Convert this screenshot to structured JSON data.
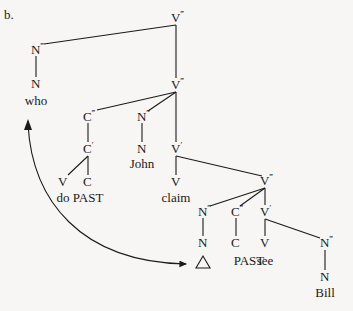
{
  "example_label": "b.",
  "tree": {
    "nodes": [
      {
        "id": "vmax1",
        "cat": "V",
        "bar": "‴",
        "x": 176,
        "y": 22
      },
      {
        "id": "nmax_who",
        "cat": "N",
        "bar": "‴",
        "x": 36,
        "y": 54
      },
      {
        "id": "n_who",
        "cat": "N",
        "bar": "",
        "x": 36,
        "y": 88
      },
      {
        "id": "vmax2",
        "cat": "V",
        "bar": "‴",
        "x": 176,
        "y": 89
      },
      {
        "id": "cmax1",
        "cat": "C",
        "bar": "‴",
        "x": 88,
        "y": 121
      },
      {
        "id": "nmax_john",
        "cat": "N",
        "bar": "‴",
        "x": 142,
        "y": 121
      },
      {
        "id": "cbar1",
        "cat": "C",
        "bar": "′",
        "x": 88,
        "y": 153
      },
      {
        "id": "n_john",
        "cat": "N",
        "bar": "",
        "x": 142,
        "y": 153
      },
      {
        "id": "vbar1",
        "cat": "V",
        "bar": "′",
        "x": 176,
        "y": 153
      },
      {
        "id": "v_do",
        "cat": "V",
        "bar": "",
        "x": 63,
        "y": 186
      },
      {
        "id": "c_past1",
        "cat": "C",
        "bar": "",
        "x": 88,
        "y": 186
      },
      {
        "id": "v_claim",
        "cat": "V",
        "bar": "",
        "x": 176,
        "y": 186
      },
      {
        "id": "vmax3",
        "cat": "V",
        "bar": "‴",
        "x": 265,
        "y": 185
      },
      {
        "id": "nmax_trace",
        "cat": "N",
        "bar": "‴",
        "x": 203,
        "y": 216
      },
      {
        "id": "cmax2",
        "cat": "C",
        "bar": "‴",
        "x": 236,
        "y": 216
      },
      {
        "id": "vbar2",
        "cat": "V",
        "bar": "′",
        "x": 265,
        "y": 216
      },
      {
        "id": "n_trace",
        "cat": "N",
        "bar": "",
        "x": 203,
        "y": 247
      },
      {
        "id": "c_past2",
        "cat": "C",
        "bar": "",
        "x": 236,
        "y": 247
      },
      {
        "id": "v_see",
        "cat": "V",
        "bar": "",
        "x": 265,
        "y": 247
      },
      {
        "id": "nmax_bill",
        "cat": "N",
        "bar": "‴",
        "x": 325,
        "y": 247
      },
      {
        "id": "n_bill",
        "cat": "N",
        "bar": "",
        "x": 325,
        "y": 281
      }
    ],
    "words": [
      {
        "id": "who",
        "text": "who",
        "x": 36,
        "y": 105
      },
      {
        "id": "john",
        "text": "John",
        "x": 142,
        "y": 168
      },
      {
        "id": "do_past",
        "text": "do PAST",
        "x": 80,
        "y": 202
      },
      {
        "id": "claim",
        "text": "claim",
        "x": 176,
        "y": 202
      },
      {
        "id": "past2",
        "text": "PAST",
        "x": 249,
        "y": 265
      },
      {
        "id": "see",
        "text": "see",
        "x": 265,
        "y": 265
      },
      {
        "id": "bill",
        "text": "Bill",
        "x": 325,
        "y": 297
      }
    ],
    "edges": [
      [
        176,
        25,
        44,
        44
      ],
      [
        176,
        25,
        176,
        78
      ],
      [
        36,
        56,
        36,
        77
      ],
      [
        176,
        92,
        97,
        110
      ],
      [
        176,
        92,
        148,
        111
      ],
      [
        176,
        92,
        176,
        142
      ],
      [
        88,
        123,
        88,
        142
      ],
      [
        142,
        123,
        142,
        142
      ],
      [
        88,
        156,
        68,
        175
      ],
      [
        88,
        156,
        88,
        175
      ],
      [
        176,
        156,
        176,
        175
      ],
      [
        176,
        156,
        262,
        176
      ],
      [
        265,
        188,
        210,
        206
      ],
      [
        265,
        188,
        240,
        206
      ],
      [
        265,
        188,
        265,
        205
      ],
      [
        203,
        218,
        203,
        236
      ],
      [
        236,
        218,
        236,
        236
      ],
      [
        265,
        219,
        265,
        236
      ],
      [
        265,
        219,
        320,
        238
      ],
      [
        325,
        250,
        325,
        270
      ]
    ],
    "trace_symbol": "triangle",
    "movement_arrow": {
      "from": "who",
      "to": "trace",
      "bidirectional": true
    }
  }
}
